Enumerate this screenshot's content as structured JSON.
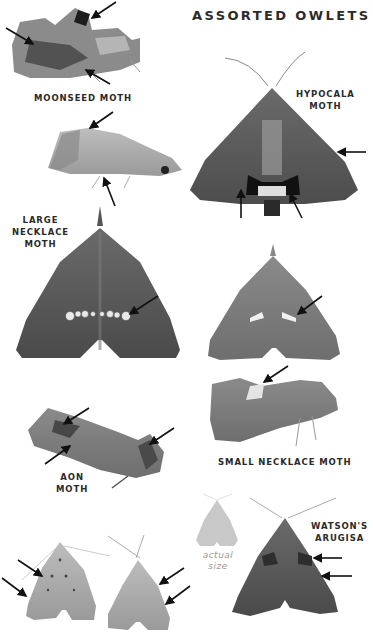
{
  "page": {
    "title": "ASSORTED OWLETS",
    "background": "#ffffff"
  },
  "species": [
    {
      "id": "moonseed",
      "label_lines": [
        "MOONSEED MOTH"
      ],
      "view": "side",
      "arrows": 3
    },
    {
      "id": "moonseed-alt",
      "label_lines": [],
      "view": "side",
      "arrows": 2
    },
    {
      "id": "hypocala",
      "label_lines": [
        "HYPOCALA",
        "MOTH"
      ],
      "view": "dorsal",
      "arrows": 3
    },
    {
      "id": "large-necklace",
      "label_lines": [
        "LARGE",
        "NECKLACE",
        "MOTH"
      ],
      "view": "dorsal",
      "arrows": 1
    },
    {
      "id": "small-necklace",
      "label_lines": [
        "SMALL NECKLACE MOTH"
      ],
      "views": [
        "dorsal",
        "side"
      ],
      "arrows": 2
    },
    {
      "id": "aon",
      "label_lines": [
        "AON",
        "MOTH"
      ],
      "view": "side",
      "arrows": 3
    },
    {
      "id": "unlabeled-pair",
      "label_lines": [],
      "view": "dorsal",
      "arrows": 4
    },
    {
      "id": "watsons-arugisa",
      "label_lines": [
        "WATSON'S",
        "ARUGISA"
      ],
      "view": "dorsal",
      "arrows": 2
    }
  ],
  "size_reference": {
    "caption_lines": [
      "actual",
      "size"
    ],
    "color": "#c8c8c8"
  },
  "labels": {
    "moonseed": "MOONSEED MOTH",
    "hypocala_1": "HYPOCALA",
    "hypocala_2": "MOTH",
    "large_necklace_1": "LARGE",
    "large_necklace_2": "NECKLACE",
    "large_necklace_3": "MOTH",
    "small_necklace": "SMALL NECKLACE MOTH",
    "aon_1": "AON",
    "aon_2": "MOTH",
    "watsons_1": "WATSON'S",
    "watsons_2": "ARUGISA",
    "actual_1": "actual",
    "actual_2": "size"
  }
}
